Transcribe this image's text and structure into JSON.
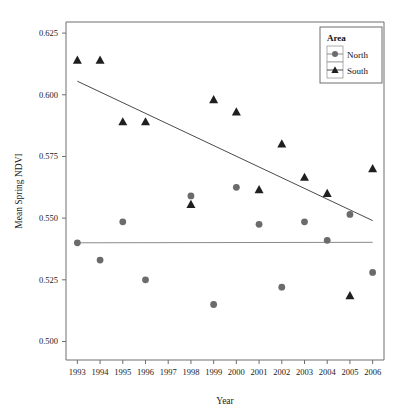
{
  "chart_data": {
    "type": "scatter",
    "title": "",
    "xlabel": "Year",
    "ylabel": "Mean Spring NDVI",
    "x": [
      1993,
      1994,
      1995,
      1996,
      1997,
      1998,
      1999,
      2000,
      2001,
      2002,
      2003,
      2004,
      2005,
      2006
    ],
    "xtick_labels": [
      "1993",
      "1994",
      "1995",
      "1996",
      "1997",
      "1998",
      "1999",
      "2000",
      "2001",
      "2002",
      "2003",
      "2004",
      "2005",
      "2006"
    ],
    "xlim": [
      1992.5,
      2006.5
    ],
    "ylim": [
      0.4925,
      0.6295
    ],
    "ytick_labels": [
      "0.500",
      "0.525",
      "0.550",
      "0.575",
      "0.600",
      "0.625"
    ],
    "yticks": [
      0.5,
      0.525,
      0.55,
      0.575,
      0.6,
      0.625
    ],
    "grid": false,
    "legend_position": "top-right",
    "legend_title": "Area",
    "series": [
      {
        "name": "North",
        "marker": "circle",
        "color": "#6b6b6b",
        "points": [
          {
            "x": 1993,
            "y": 0.54
          },
          {
            "x": 1994,
            "y": 0.533
          },
          {
            "x": 1995,
            "y": 0.5485
          },
          {
            "x": 1996,
            "y": 0.525
          },
          {
            "x": 1998,
            "y": 0.559
          },
          {
            "x": 1999,
            "y": 0.515
          },
          {
            "x": 2000,
            "y": 0.5625
          },
          {
            "x": 2001,
            "y": 0.5475
          },
          {
            "x": 2002,
            "y": 0.522
          },
          {
            "x": 2003,
            "y": 0.5485
          },
          {
            "x": 2004,
            "y": 0.541
          },
          {
            "x": 2005,
            "y": 0.5515
          },
          {
            "x": 2006,
            "y": 0.528
          }
        ],
        "trendline": {
          "x0": 1993,
          "y0": 0.54,
          "x1": 2006,
          "y1": 0.5402
        }
      },
      {
        "name": "South",
        "marker": "triangle",
        "color": "#1f1f1f",
        "points": [
          {
            "x": 1993,
            "y": 0.614
          },
          {
            "x": 1994,
            "y": 0.614
          },
          {
            "x": 1995,
            "y": 0.589
          },
          {
            "x": 1996,
            "y": 0.589
          },
          {
            "x": 1998,
            "y": 0.5555
          },
          {
            "x": 1999,
            "y": 0.598
          },
          {
            "x": 2000,
            "y": 0.593
          },
          {
            "x": 2001,
            "y": 0.5615
          },
          {
            "x": 2002,
            "y": 0.58
          },
          {
            "x": 2003,
            "y": 0.5665
          },
          {
            "x": 2004,
            "y": 0.56
          },
          {
            "x": 2005,
            "y": 0.5185
          },
          {
            "x": 2006,
            "y": 0.57
          }
        ],
        "trendline": {
          "x0": 1993,
          "y0": 0.6055,
          "x1": 2006,
          "y1": 0.549
        }
      }
    ]
  },
  "legend": {
    "title": "Area",
    "entries": [
      {
        "label": "North",
        "marker": "circle-marker-icon"
      },
      {
        "label": "South",
        "marker": "triangle-marker-icon"
      }
    ]
  },
  "axes": {
    "x_title": "Year",
    "y_title": "Mean Spring NDVI"
  }
}
